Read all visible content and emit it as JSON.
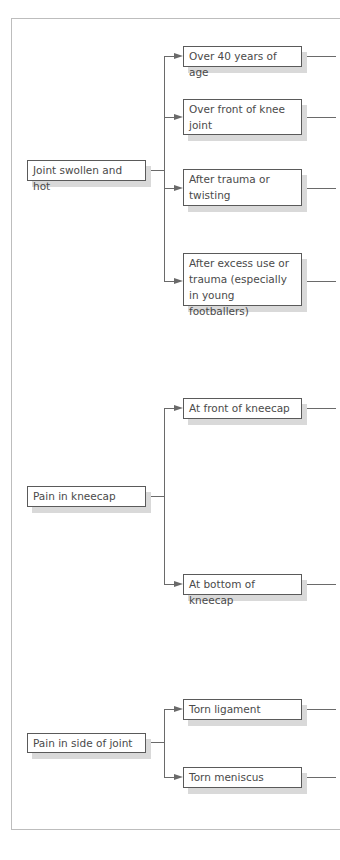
{
  "diagram": {
    "type": "flowchart-tree",
    "colors": {
      "line": "#6a6a6a",
      "box_border": "#5a5a5a",
      "box_shadow": "#d9d9d9",
      "text": "#4a4a4a",
      "frame": "#bdbdbd"
    },
    "groups": [
      {
        "root": {
          "label": "Joint swollen and hot"
        },
        "children": [
          {
            "label": "Over 40 years of age"
          },
          {
            "label": "Over front of knee joint"
          },
          {
            "label": "After trauma or twisting"
          },
          {
            "label": "After excess use or trauma (especially in young footballers)"
          }
        ]
      },
      {
        "root": {
          "label": "Pain in kneecap"
        },
        "children": [
          {
            "label": "At front of kneecap"
          },
          {
            "label": "At bottom of kneecap"
          }
        ]
      },
      {
        "root": {
          "label": "Pain in side of joint"
        },
        "children": [
          {
            "label": "Torn ligament"
          },
          {
            "label": "Torn meniscus"
          }
        ]
      }
    ]
  }
}
